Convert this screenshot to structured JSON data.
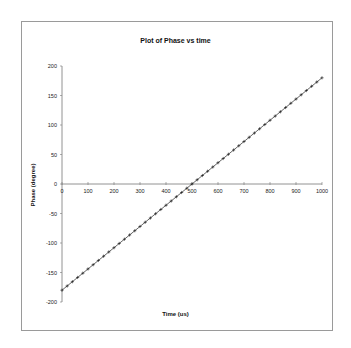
{
  "chart_data": {
    "type": "line",
    "title": "Plot of Phase vs time",
    "xlabel": "Time (us)",
    "ylabel": "Phase (degree)",
    "xlim": [
      0,
      1000
    ],
    "ylim": [
      -200,
      200
    ],
    "x_ticks": [
      0,
      100,
      200,
      300,
      400,
      500,
      600,
      700,
      800,
      900,
      1000
    ],
    "y_ticks": [
      200,
      150,
      100,
      50,
      0,
      -50,
      -100,
      -150,
      -200
    ],
    "grid": false,
    "legend": null,
    "marker": "+",
    "series": [
      {
        "name": "Phase",
        "x": [
          0,
          20,
          40,
          60,
          80,
          100,
          120,
          140,
          160,
          180,
          200,
          220,
          240,
          260,
          280,
          300,
          320,
          340,
          360,
          380,
          400,
          420,
          440,
          460,
          480,
          500,
          520,
          540,
          560,
          580,
          600,
          620,
          640,
          660,
          680,
          700,
          720,
          740,
          760,
          780,
          800,
          820,
          840,
          860,
          880,
          900,
          920,
          940,
          960,
          980,
          1000
        ],
        "values": [
          -180,
          -172.8,
          -165.6,
          -158.4,
          -151.2,
          -144,
          -136.8,
          -129.6,
          -122.4,
          -115.2,
          -108,
          -100.8,
          -93.6,
          -86.4,
          -79.2,
          -72,
          -64.8,
          -57.6,
          -50.4,
          -43.2,
          -36,
          -28.8,
          -21.6,
          -14.4,
          -7.2,
          0,
          7.2,
          14.4,
          21.6,
          28.8,
          36,
          43.2,
          50.4,
          57.6,
          64.8,
          72,
          79.2,
          86.4,
          93.6,
          100.8,
          108,
          115.2,
          122.4,
          129.6,
          136.8,
          144,
          151.2,
          158.4,
          165.6,
          172.8,
          180
        ]
      }
    ]
  }
}
